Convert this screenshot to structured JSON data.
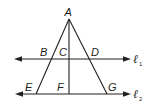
{
  "diagram": {
    "points": {
      "A": "A",
      "B": "B",
      "C": "C",
      "D": "D",
      "E": "E",
      "F": "F",
      "G": "G"
    },
    "lines": {
      "l1": {
        "symbol": "ℓ",
        "subscript": "1"
      },
      "l2": {
        "symbol": "ℓ",
        "subscript": "2"
      }
    },
    "colors": {
      "stroke": "#231f20",
      "background": "#ffffff"
    }
  }
}
